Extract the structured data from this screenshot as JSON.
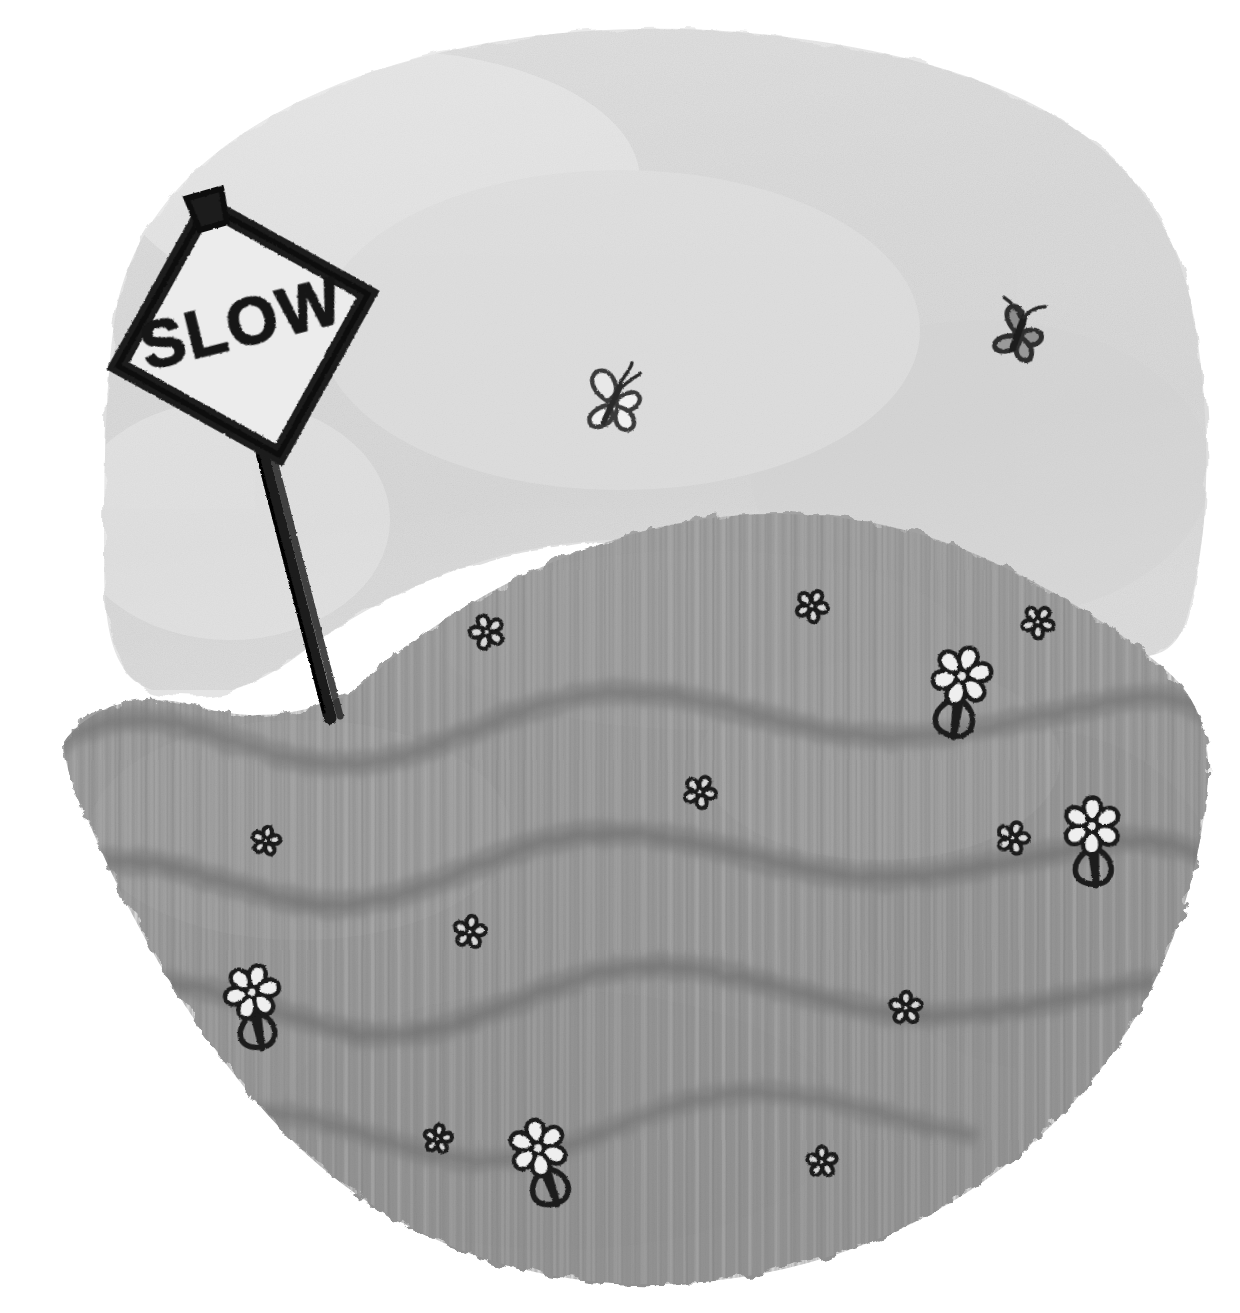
{
  "artwork": {
    "title": "SLOW sign on a grassy hill",
    "medium": "pencil and grey watercolour wash on white paper",
    "background_color": "#ffffff"
  },
  "sky": {
    "name": "sky-wash",
    "fill_color": "#e3e3e3",
    "edge_color": "#d7d7d7",
    "description": "soft pale grey watercolour wash with ragged torn edges"
  },
  "hill": {
    "name": "grassy-hill",
    "base_color": "#9c9c9c",
    "light_color": "#aaaaaa",
    "band_color": "#7b7b7b",
    "hatch_color": "#868686",
    "description": "grey hill with vertical pencil hatching and three dark wavy contour bands"
  },
  "sign": {
    "label": "SLOW",
    "shape": "diamond",
    "face_color": "#ececec",
    "border_color": "#1a1a1a",
    "post_color": "#1c1c1c",
    "rotation_degrees": -16,
    "cap": "sign-top-cap"
  },
  "insects": [
    {
      "name": "butterfly-outline",
      "x": 612,
      "y": 404,
      "size": 62,
      "style": "outline",
      "color": "#3a3a3a"
    },
    {
      "name": "butterfly-filled",
      "x": 1018,
      "y": 335,
      "size": 56,
      "style": "filled",
      "color": "#4a4a4a"
    }
  ],
  "flowers": [
    {
      "name": "clover-small",
      "x": 487,
      "y": 632,
      "size": 34,
      "type": "clover",
      "stem": false
    },
    {
      "name": "clover-small",
      "x": 812,
      "y": 606,
      "size": 32,
      "type": "clover",
      "stem": false
    },
    {
      "name": "clover-small",
      "x": 1038,
      "y": 622,
      "size": 32,
      "type": "clover",
      "stem": false
    },
    {
      "name": "daisy-with-stem",
      "x": 962,
      "y": 676,
      "size": 54,
      "type": "daisy",
      "stem": true
    },
    {
      "name": "clover-small",
      "x": 700,
      "y": 792,
      "size": 32,
      "type": "clover",
      "stem": false
    },
    {
      "name": "clover-small",
      "x": 266,
      "y": 841,
      "size": 28,
      "type": "clover",
      "stem": false
    },
    {
      "name": "clover-small",
      "x": 1013,
      "y": 838,
      "size": 32,
      "type": "clover",
      "stem": false
    },
    {
      "name": "daisy-with-stem",
      "x": 1092,
      "y": 826,
      "size": 52,
      "type": "daisy",
      "stem": true
    },
    {
      "name": "clover-small",
      "x": 470,
      "y": 932,
      "size": 32,
      "type": "clover",
      "stem": false
    },
    {
      "name": "daisy-with-stem",
      "x": 252,
      "y": 992,
      "size": 50,
      "type": "daisy",
      "stem": true
    },
    {
      "name": "clover-small",
      "x": 906,
      "y": 1008,
      "size": 32,
      "type": "clover",
      "stem": false
    },
    {
      "name": "clover-small",
      "x": 438,
      "y": 1139,
      "size": 28,
      "type": "clover",
      "stem": false
    },
    {
      "name": "daisy-with-stem",
      "x": 538,
      "y": 1148,
      "size": 52,
      "type": "daisy",
      "stem": true
    },
    {
      "name": "clover-small",
      "x": 822,
      "y": 1162,
      "size": 30,
      "type": "clover",
      "stem": false
    }
  ],
  "palette": {
    "paper": "#ffffff",
    "sky": "#e3e3e3",
    "grass_light": "#ababab",
    "grass_mid": "#9a9a9a",
    "grass_dark": "#7a7a7a",
    "ink": "#1a1a1a"
  }
}
